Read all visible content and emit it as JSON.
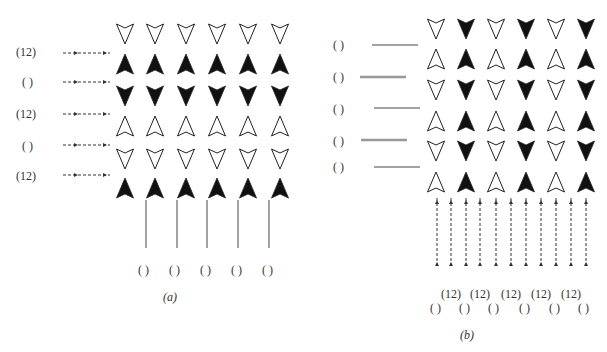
{
  "panel_a": {
    "caption": "(a)",
    "row_labels": [
      "(12)",
      "( )",
      "(12)",
      "( )",
      "(12)"
    ],
    "bottom_labels": [
      "( )",
      "( )",
      "( )",
      "( )",
      "( )"
    ],
    "rows": [
      "down-open",
      "up-filled",
      "down-filled",
      "up-open",
      "down-open",
      "up-filled"
    ],
    "columns": 6
  },
  "panel_b": {
    "caption": "(b)",
    "row_labels": [
      "( )",
      "( )",
      "( )",
      "( )",
      "( )"
    ],
    "bottom_labels_top": [
      "(12)",
      "(12)",
      "(12)",
      "(12)",
      "(12)"
    ],
    "bottom_labels_bottom": [
      "( )",
      "( )",
      "( )",
      "( )",
      "( )",
      "( )"
    ],
    "row_pattern": [
      [
        "down-open",
        "down-filled",
        "down-open",
        "down-filled",
        "down-open",
        "down-filled"
      ],
      [
        "up-open",
        "up-filled",
        "up-open",
        "up-filled",
        "up-open",
        "up-filled"
      ],
      [
        "down-open",
        "down-filled",
        "down-open",
        "down-filled",
        "down-open",
        "down-filled"
      ],
      [
        "up-open",
        "up-filled",
        "up-open",
        "up-filled",
        "up-open",
        "up-filled"
      ],
      [
        "down-open",
        "down-filled",
        "down-open",
        "down-filled",
        "down-open",
        "down-filled"
      ],
      [
        "up-open",
        "up-filled",
        "up-open",
        "up-filled",
        "up-open",
        "up-filled"
      ]
    ]
  }
}
